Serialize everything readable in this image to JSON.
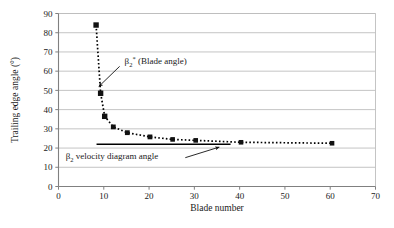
{
  "chart_data": {
    "type": "scatter",
    "title": "",
    "xlabel": "Blade number",
    "ylabel": "Trailing edge angle (°)",
    "xlim": [
      0,
      70
    ],
    "ylim": [
      0,
      90
    ],
    "xticks": [
      0,
      10,
      20,
      30,
      40,
      50,
      60,
      70
    ],
    "yticks": [
      0,
      10,
      20,
      30,
      40,
      50,
      60,
      70,
      80,
      90
    ],
    "grid": "horizontal",
    "legend": "none",
    "series": [
      {
        "name": "β₂* (Blade angle)",
        "marker": "filled-square",
        "line": "dotted",
        "color": "#000000",
        "x": [
          8.3,
          9.3,
          10.2,
          12.1,
          15.2,
          20.2,
          25.2,
          30.3,
          40.3,
          60.4
        ],
        "y": [
          84.0,
          48.5,
          36.5,
          31.0,
          28.0,
          25.8,
          24.5,
          24.0,
          23.0,
          22.5
        ]
      },
      {
        "name": "β₂ velocity diagram angle",
        "marker": "none",
        "line": "solid",
        "color": "#000000",
        "x": [
          8.4,
          38.0
        ],
        "y": [
          22.0,
          22.0
        ]
      }
    ],
    "annotations": [
      {
        "id": "blade-angle-annotation",
        "text_parts": {
          "beta": "β",
          "sub": "2",
          "sup": "*",
          "rest": " (Blade angle)"
        },
        "text": "β₂* (Blade angle)",
        "arrow_from": [
          13.5,
          62.5
        ],
        "arrow_to": [
          8.9,
          52.0
        ]
      },
      {
        "id": "velocity-diagram-annotation",
        "text_parts": {
          "beta": "β",
          "sub": "2",
          "sup": "",
          "rest": " velocity diagram angle"
        },
        "text": "β₂ velocity diagram angle",
        "arrow_from": [
          28.0,
          15.0
        ],
        "arrow_to": [
          35.5,
          20.5
        ]
      }
    ],
    "colors": {
      "axis": "#808080",
      "grid": "#bdbdbd",
      "marker": "#111111",
      "text": "#1a1a1a",
      "background": "#ffffff"
    }
  },
  "axes": {
    "x_tick_labels": [
      "0",
      "10",
      "20",
      "30",
      "40",
      "50",
      "60",
      "70"
    ],
    "y_tick_labels": [
      "0",
      "10",
      "20",
      "30",
      "40",
      "50",
      "60",
      "70",
      "80",
      "90"
    ],
    "x_title": "Blade number",
    "y_title": "Trailing edge angle (°)"
  }
}
